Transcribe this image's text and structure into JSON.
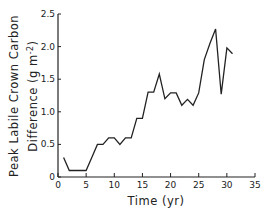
{
  "chart_data": {
    "type": "line",
    "title": "",
    "xlabel": "Time (yr)",
    "ylabel_line1": "Peak Labile Crown Carbon",
    "ylabel_line2": "Difference (g m-2)",
    "ylabel": "Peak Labile Crown Carbon Difference (g m-2)",
    "xlim": [
      0,
      35
    ],
    "ylim": [
      0,
      2.5
    ],
    "xticks": [
      0,
      5,
      10,
      15,
      20,
      25,
      30,
      35
    ],
    "xtick_labels": [
      "0",
      "5",
      "10",
      "15",
      "20",
      "25",
      "30",
      "35"
    ],
    "yticks": [
      0,
      0.5,
      1.0,
      1.5,
      2.0,
      2.5
    ],
    "ytick_labels": [
      "0",
      "0.5",
      "1.0",
      "1.5",
      "2.0",
      "2.5"
    ],
    "grid": false,
    "legend": null,
    "series": [
      {
        "name": "Peak labile crown carbon difference",
        "color": "#222222",
        "x": [
          1,
          2,
          3,
          4,
          5,
          6,
          7,
          8,
          9,
          10,
          11,
          12,
          13,
          14,
          15,
          16,
          17,
          18,
          19,
          20,
          21,
          22,
          23,
          24,
          25,
          26,
          27,
          28,
          29,
          30,
          31
        ],
        "y": [
          0.3,
          0.1,
          0.1,
          0.1,
          0.1,
          0.3,
          0.5,
          0.5,
          0.6,
          0.6,
          0.5,
          0.6,
          0.6,
          0.9,
          0.9,
          1.3,
          1.3,
          1.58,
          1.2,
          1.29,
          1.29,
          1.1,
          1.19,
          1.1,
          1.29,
          1.8,
          2.05,
          2.27,
          1.27,
          1.98,
          1.89
        ]
      }
    ]
  }
}
